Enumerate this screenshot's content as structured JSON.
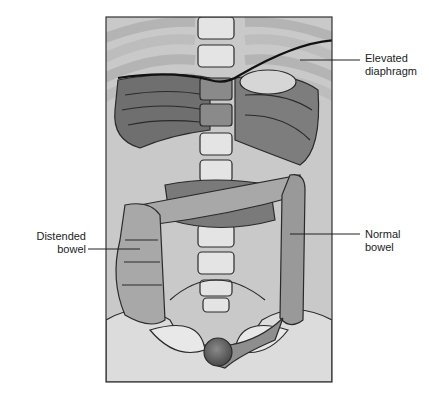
{
  "figure": {
    "type": "anatomical-illustration",
    "labels": {
      "diaphragm": {
        "line1": "Elevated",
        "line2": "diaphragm"
      },
      "distended_bowel": {
        "line1": "Distended",
        "line2": "bowel"
      },
      "normal_bowel": {
        "line1": "Normal",
        "line2": "bowel"
      }
    },
    "colors": {
      "background": "#c9c9c9",
      "bone": "#e4e4e4",
      "rib": "#b4b4b4",
      "organ_dark": "#6f6f6f",
      "organ_mid": "#8c8c8c",
      "bowel": "#aaaaaa",
      "outline": "#2a2a2a",
      "rectum": "#5e5e5e"
    }
  }
}
